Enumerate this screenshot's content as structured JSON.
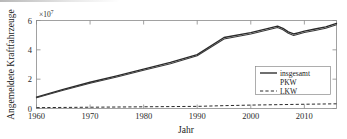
{
  "chart_data": {
    "type": "line",
    "title": "",
    "xlabel": "Jahr",
    "ylabel": "Angemeldete Kraftfahrzeuge",
    "y_exponent_label": "×10",
    "y_exponent_power": "7",
    "y_multiplier": 10000000,
    "xlim": [
      1960,
      2016
    ],
    "ylim": [
      0,
      6.2
    ],
    "xticks": [
      1960,
      1970,
      1980,
      1990,
      2000,
      2010
    ],
    "xtick_labels": [
      "1960",
      "1970",
      "1980",
      "1990",
      "2000",
      "2010"
    ],
    "yticks": [
      0,
      2,
      4,
      6
    ],
    "ytick_labels": [
      "0",
      "2",
      "4",
      "6"
    ],
    "grid": false,
    "legend_position": "lower right",
    "series": [
      {
        "name": "insgesamt",
        "style": "solid",
        "color": "#2a2a2a",
        "x": [
          1960,
          1965,
          1970,
          1975,
          1980,
          1985,
          1990,
          1995,
          2000,
          2005,
          2006,
          2007,
          2008,
          2009,
          2010,
          2012,
          2014,
          2016
        ],
        "values": [
          0.8,
          1.35,
          1.85,
          2.3,
          2.78,
          3.25,
          3.8,
          5.0,
          5.35,
          5.8,
          5.65,
          5.4,
          5.25,
          5.35,
          5.45,
          5.6,
          5.75,
          6.0
        ]
      },
      {
        "name": "PKW",
        "style": "solid",
        "color": "#3a3a3a",
        "x": [
          1960,
          1965,
          1970,
          1975,
          1980,
          1985,
          1990,
          1995,
          2000,
          2005,
          2006,
          2007,
          2008,
          2009,
          2010,
          2012,
          2014,
          2016
        ],
        "values": [
          0.75,
          1.28,
          1.78,
          2.22,
          2.7,
          3.16,
          3.72,
          4.9,
          5.25,
          5.7,
          5.55,
          5.3,
          5.15,
          5.25,
          5.35,
          5.5,
          5.65,
          5.9
        ]
      },
      {
        "name": "LKW",
        "style": "dashed",
        "color": "#2a2a2a",
        "x": [
          1960,
          1970,
          1980,
          1990,
          1995,
          2000,
          2005,
          2010,
          2016
        ],
        "values": [
          0.06,
          0.09,
          0.12,
          0.15,
          0.2,
          0.24,
          0.27,
          0.3,
          0.33
        ]
      }
    ],
    "legend_entries": [
      {
        "label": "insgesamt",
        "style": "solid"
      },
      {
        "label": "PKW",
        "style": "solid-hidden"
      },
      {
        "label": "LKW",
        "style": "dashed"
      }
    ]
  }
}
